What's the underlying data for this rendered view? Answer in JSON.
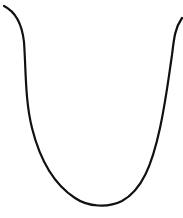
{
  "figure": {
    "background": "#ffffff",
    "stroke_color": "#111111",
    "stroke_width": 2.2,
    "shape": "U-shaped curve",
    "path": "M 4 6 C 16 12, 22 24, 24 42 C 26 70, 25 100, 32 128 C 40 160, 55 185, 75 198 C 88 207, 108 208, 122 201 C 142 190, 152 165, 160 128 C 166 100, 169 75, 172 55 C 174 38, 175 28, 182 18"
  }
}
